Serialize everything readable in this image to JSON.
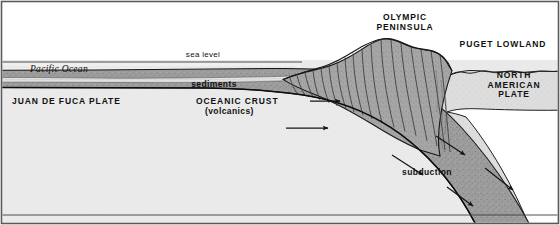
{
  "figure": {
    "type": "geologic-cross-section",
    "width": 560,
    "height": 225
  },
  "labels": {
    "sea_level": "sea level",
    "pacific_ocean": "Pacific Ocean",
    "sediments": "sediments",
    "juan_de_fuca_plate": "JUAN DE FUCA PLATE",
    "oceanic_crust": "OCEANIC CRUST",
    "oceanic_crust_sub": "(volcanics)",
    "olympic_peninsula_line1": "OLYMPIC",
    "olympic_peninsula_line2": "PENINSULA",
    "puget_lowland": "PUGET LOWLAND",
    "north_american_plate_line1": "NORTH",
    "north_american_plate_line2": "AMERICAN",
    "north_american_plate_line3": "PLATE",
    "subduction": "subduction"
  },
  "colors": {
    "sky": "#ffffff",
    "ocean_water": "#efefef",
    "sediment_layer": "#e4e4e4",
    "oceanic_crust": "#9d9d9d",
    "mantle": "#e9e9e9",
    "accretionary_wedge": "#a3a3a3",
    "north_american_plate": "#dcdcdc",
    "mantle_wedge": "#ffffff",
    "outline": "#1a1a1a",
    "text": "#111111",
    "frame": "#555555"
  },
  "arrows": [
    {
      "name": "convergence-arrow-upper",
      "label": "",
      "x1": 310,
      "y1": 101,
      "x2": 342,
      "y2": 101,
      "direction": "east"
    },
    {
      "name": "convergence-arrow-lower",
      "label": "",
      "x1": 286,
      "y1": 128,
      "x2": 330,
      "y2": 128,
      "direction": "east"
    },
    {
      "name": "subduction-arrow-1",
      "label": "",
      "x1": 436,
      "y1": 136,
      "x2": 467,
      "y2": 157,
      "direction": "southeast"
    },
    {
      "name": "subduction-arrow-2",
      "label": "",
      "x1": 392,
      "y1": 155,
      "x2": 425,
      "y2": 177,
      "direction": "southeast"
    },
    {
      "name": "subduction-arrow-3",
      "label": "",
      "x1": 485,
      "y1": 168,
      "x2": 515,
      "y2": 192,
      "direction": "southeast"
    },
    {
      "name": "subduction-arrow-4",
      "label": "",
      "x1": 447,
      "y1": 187,
      "x2": 475,
      "y2": 208,
      "direction": "southeast"
    }
  ],
  "layers": [
    {
      "name": "sky",
      "description": "atmosphere above sea level"
    },
    {
      "name": "ocean-water",
      "description": "Pacific Ocean water column"
    },
    {
      "name": "sediments",
      "description": "sediment layer on ocean floor"
    },
    {
      "name": "oceanic-crust",
      "description": "subducting Juan de Fuca oceanic crust slab"
    },
    {
      "name": "mantle",
      "description": "upper mantle beneath the plates"
    },
    {
      "name": "accretionary-wedge",
      "description": "thrust-faulted Olympic Peninsula accretionary wedge"
    },
    {
      "name": "north-american-plate",
      "description": "overriding continental plate / Puget Lowland"
    }
  ]
}
